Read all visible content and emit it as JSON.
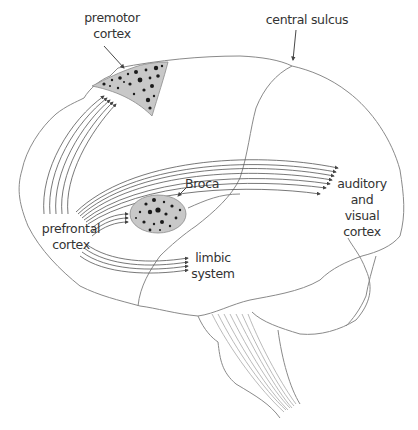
{
  "figure": {
    "colors": {
      "outline": "#8a8a8a",
      "fibers": "#555555",
      "region_fill": "#c8c8c8",
      "dots": "#1a1a1a",
      "text": "#333333"
    },
    "labels": {
      "premotor": "premotor\ncortex",
      "central_sulcus": "central sulcus",
      "broca": "Broca",
      "prefrontal": "prefrontal\ncortex",
      "limbic": "limbic\nsystem",
      "auditory_visual": "auditory\nand\nvisual\ncortex"
    }
  }
}
